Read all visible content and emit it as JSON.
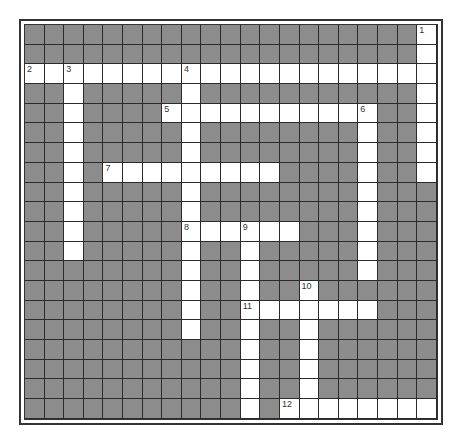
{
  "puzzle": {
    "rows": 20,
    "cols": 21,
    "colors": {
      "block": "#8c8c8c",
      "open": "#ffffff",
      "grid_line": "#2b2b2b",
      "frame": "#333333"
    },
    "entries": [
      {
        "number": 1,
        "direction": "down",
        "row": 0,
        "col": 20,
        "length": 8
      },
      {
        "number": 2,
        "direction": "across",
        "row": 2,
        "col": 0,
        "length": 21
      },
      {
        "number": 3,
        "direction": "down",
        "row": 2,
        "col": 2,
        "length": 10
      },
      {
        "number": 4,
        "direction": "down",
        "row": 2,
        "col": 8,
        "length": 14
      },
      {
        "number": 5,
        "direction": "across",
        "row": 4,
        "col": 7,
        "length": 11
      },
      {
        "number": 6,
        "direction": "down",
        "row": 4,
        "col": 17,
        "length": 9
      },
      {
        "number": 7,
        "direction": "across",
        "row": 7,
        "col": 4,
        "length": 9
      },
      {
        "number": 8,
        "direction": "across",
        "row": 10,
        "col": 8,
        "length": 6
      },
      {
        "number": 9,
        "direction": "down",
        "row": 10,
        "col": 11,
        "length": 10
      },
      {
        "number": 10,
        "direction": "down",
        "row": 13,
        "col": 14,
        "length": 7
      },
      {
        "number": 11,
        "direction": "across",
        "row": 14,
        "col": 11,
        "length": 7
      },
      {
        "number": 12,
        "direction": "across",
        "row": 19,
        "col": 13,
        "length": 8
      }
    ]
  }
}
